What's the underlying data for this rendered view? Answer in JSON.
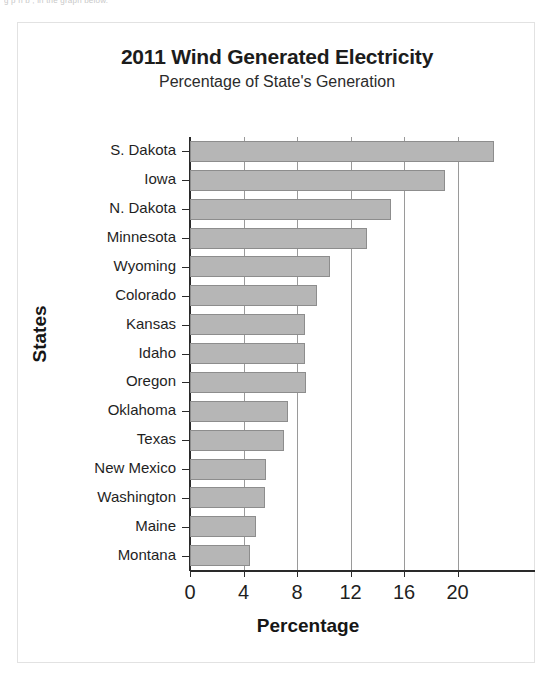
{
  "page": {
    "scan_top_text": "g p             n  b   , in  the graph below.",
    "background": "#ffffff",
    "frame_border_color": "#e2e2e2"
  },
  "chart_data": {
    "type": "bar",
    "orientation": "horizontal",
    "title": "2011 Wind Generated Electricity",
    "subtitle": "Percentage of State's Generation",
    "xlabel": "Percentage",
    "ylabel": "States",
    "categories": [
      "S. Dakota",
      "Iowa",
      "N. Dakota",
      "Minnesota",
      "Wyoming",
      "Colorado",
      "Kansas",
      "Idaho",
      "Oregon",
      "Oklahoma",
      "Texas",
      "New Mexico",
      "Washington",
      "Maine",
      "Montana"
    ],
    "values": [
      22.7,
      19.1,
      15.0,
      13.2,
      10.5,
      9.5,
      8.6,
      8.6,
      8.7,
      7.3,
      7.0,
      5.7,
      5.6,
      4.9,
      4.5
    ],
    "xticks": [
      0,
      4,
      8,
      12,
      16,
      20
    ],
    "xtick_labels": [
      "0",
      "4",
      "8",
      "12",
      "16",
      "20"
    ],
    "xlim": [
      0,
      24
    ],
    "grid": "vertical",
    "legend": "none",
    "bar_color": "#b6b6b6",
    "bar_edge_color": "#8d8d8d",
    "axis_color": "#2a2a2a",
    "gridline_color": "#9a9a9a"
  }
}
